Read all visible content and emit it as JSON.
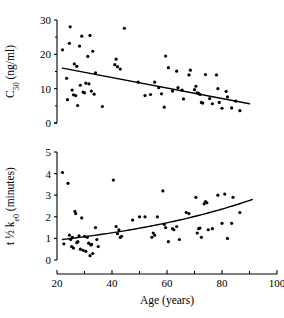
{
  "figure": {
    "background": "#ffffff",
    "ink": "#000000",
    "width": 284,
    "height": 318
  },
  "axis_shared": {
    "xlabel": "Age (years)",
    "xticks": [
      20,
      40,
      60,
      80,
      100
    ],
    "xlim": [
      20,
      100
    ]
  },
  "chart_data": [
    {
      "type": "scatter",
      "id": "c50-vs-age",
      "title": "",
      "xlabel": "",
      "ylabel": "C50 (ng/ml)",
      "ylabel_parts": {
        "base": "C",
        "subscript": "50",
        "units": "(ng/ml)"
      },
      "xlim": [
        20,
        100
      ],
      "ylim": [
        0,
        30
      ],
      "yticks": [
        0,
        10,
        20,
        30
      ],
      "yticks_minor": [
        5,
        15,
        25
      ],
      "xticks": [
        20,
        40,
        60,
        80,
        100
      ],
      "xticklabels_visible": false,
      "grid": false,
      "legend": "none",
      "marker": "filled-circle",
      "points": [
        [
          22.0,
          21.3
        ],
        [
          23.5,
          13.0
        ],
        [
          23.8,
          6.8
        ],
        [
          24.5,
          23.2
        ],
        [
          24.8,
          28.0
        ],
        [
          25.5,
          9.6
        ],
        [
          26.0,
          8.2
        ],
        [
          26.3,
          17.2
        ],
        [
          26.8,
          8.0
        ],
        [
          27.2,
          16.5
        ],
        [
          27.5,
          5.1
        ],
        [
          28.2,
          22.4
        ],
        [
          28.5,
          11.0
        ],
        [
          29.0,
          25.3
        ],
        [
          29.5,
          9.0
        ],
        [
          30.0,
          8.8
        ],
        [
          30.5,
          11.6
        ],
        [
          31.2,
          19.4
        ],
        [
          31.6,
          11.4
        ],
        [
          32.0,
          25.5
        ],
        [
          32.5,
          9.3
        ],
        [
          33.0,
          20.9
        ],
        [
          33.5,
          8.4
        ],
        [
          34.0,
          14.6
        ],
        [
          36.5,
          4.8
        ],
        [
          41.0,
          17.0
        ],
        [
          41.5,
          18.6
        ],
        [
          42.0,
          16.4
        ],
        [
          43.0,
          15.7
        ],
        [
          44.5,
          27.6
        ],
        [
          49.5,
          11.9
        ],
        [
          52.0,
          8.0
        ],
        [
          54.0,
          8.3
        ],
        [
          55.5,
          11.9
        ],
        [
          57.0,
          10.3
        ],
        [
          58.0,
          8.5
        ],
        [
          59.0,
          4.6
        ],
        [
          59.5,
          19.5
        ],
        [
          60.5,
          16.1
        ],
        [
          62.0,
          9.3
        ],
        [
          63.5,
          15.1
        ],
        [
          64.0,
          10.3
        ],
        [
          65.5,
          9.6
        ],
        [
          66.0,
          7.0
        ],
        [
          68.0,
          14.0
        ],
        [
          68.5,
          15.4
        ],
        [
          70.0,
          9.7
        ],
        [
          70.5,
          10.7
        ],
        [
          71.0,
          8.8
        ],
        [
          71.5,
          8.6
        ],
        [
          72.0,
          8.3
        ],
        [
          72.5,
          6.0
        ],
        [
          73.0,
          5.8
        ],
        [
          74.0,
          14.1
        ],
        [
          75.5,
          7.1
        ],
        [
          76.5,
          5.6
        ],
        [
          78.0,
          14.0
        ],
        [
          78.5,
          10.0
        ],
        [
          79.0,
          6.0
        ],
        [
          80.0,
          4.3
        ],
        [
          81.5,
          9.2
        ],
        [
          82.0,
          7.6
        ],
        [
          83.5,
          4.4
        ],
        [
          85.0,
          6.4
        ],
        [
          86.5,
          3.6
        ]
      ],
      "fit": {
        "kind": "linear",
        "x": [
          22,
          90
        ],
        "y": [
          16.0,
          5.6
        ],
        "description": "decreasing linear regression line"
      }
    },
    {
      "type": "scatter",
      "id": "t-half-ke0-vs-age",
      "title": "",
      "xlabel": "Age (years)",
      "ylabel": "t 1/2 ke0 (minutes)",
      "ylabel_parts": {
        "base": "t",
        "fraction": "½",
        "rate": "k",
        "subscript": "e0",
        "units": "(minutes)"
      },
      "xlim": [
        20,
        100
      ],
      "ylim": [
        0,
        5
      ],
      "yticks": [
        0,
        1,
        2,
        3,
        4,
        5
      ],
      "xticks": [
        20,
        40,
        60,
        80,
        100
      ],
      "xticklabels_visible": true,
      "grid": false,
      "legend": "none",
      "marker": "filled-circle",
      "points": [
        [
          22.0,
          4.05
        ],
        [
          22.5,
          0.75
        ],
        [
          24.0,
          3.55
        ],
        [
          24.5,
          1.15
        ],
        [
          25.0,
          0.95
        ],
        [
          25.3,
          0.62
        ],
        [
          25.6,
          1.05
        ],
        [
          26.0,
          0.55
        ],
        [
          26.5,
          2.25
        ],
        [
          26.8,
          2.15
        ],
        [
          27.2,
          0.8
        ],
        [
          27.6,
          0.85
        ],
        [
          28.0,
          1.12
        ],
        [
          28.5,
          0.5
        ],
        [
          29.0,
          1.95
        ],
        [
          29.5,
          0.45
        ],
        [
          30.0,
          1.1
        ],
        [
          30.5,
          0.4
        ],
        [
          31.0,
          1.05
        ],
        [
          31.5,
          0.78
        ],
        [
          32.0,
          0.2
        ],
        [
          32.3,
          0.7
        ],
        [
          32.6,
          0.72
        ],
        [
          33.0,
          0.3
        ],
        [
          34.0,
          1.5
        ],
        [
          34.5,
          0.95
        ],
        [
          35.0,
          0.62
        ],
        [
          40.5,
          3.7
        ],
        [
          41.5,
          1.55
        ],
        [
          42.0,
          1.22
        ],
        [
          42.5,
          1.4
        ],
        [
          43.0,
          1.05
        ],
        [
          43.5,
          1.1
        ],
        [
          47.5,
          1.85
        ],
        [
          50.0,
          2.0
        ],
        [
          52.0,
          2.0
        ],
        [
          54.5,
          1.05
        ],
        [
          55.0,
          1.25
        ],
        [
          55.5,
          1.15
        ],
        [
          56.5,
          2.0
        ],
        [
          58.5,
          3.2
        ],
        [
          59.0,
          1.65
        ],
        [
          59.5,
          1.5
        ],
        [
          60.5,
          0.85
        ],
        [
          62.0,
          1.45
        ],
        [
          62.5,
          1.4
        ],
        [
          63.5,
          1.55
        ],
        [
          64.5,
          0.95
        ],
        [
          67.0,
          2.2
        ],
        [
          68.0,
          2.15
        ],
        [
          70.5,
          2.9
        ],
        [
          71.0,
          1.25
        ],
        [
          71.5,
          1.45
        ],
        [
          72.0,
          1.48
        ],
        [
          72.5,
          1.05
        ],
        [
          73.5,
          2.6
        ],
        [
          74.0,
          2.7
        ],
        [
          74.5,
          2.65
        ],
        [
          75.0,
          1.4
        ],
        [
          76.5,
          1.45
        ],
        [
          78.5,
          3.0
        ],
        [
          80.0,
          1.7
        ],
        [
          81.0,
          3.05
        ],
        [
          82.0,
          1.0
        ],
        [
          83.5,
          1.7
        ],
        [
          84.0,
          2.9
        ],
        [
          86.5,
          2.2
        ]
      ],
      "fit": {
        "kind": "exponential",
        "x": [
          22,
          91
        ],
        "y": [
          0.95,
          2.8
        ],
        "description": "increasing exponential regression curve"
      }
    }
  ]
}
